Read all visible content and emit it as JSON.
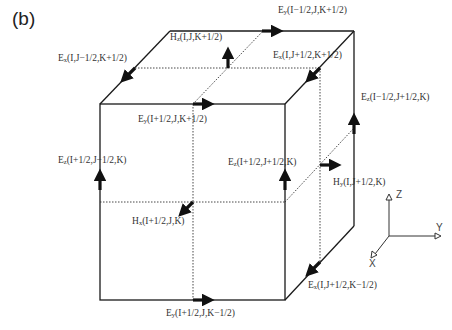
{
  "panel_label": "(b)",
  "colors": {
    "line": "#1a1a1a",
    "arrow": "#111111",
    "text": "#333333",
    "background": "#ffffff"
  },
  "labels": {
    "hz_top": {
      "sym": "H",
      "sub": "z",
      "args": "(I,J,K+1/2)"
    },
    "ey_back_top": {
      "sym": "E",
      "sub": "y",
      "args": "(I−1/2,J,K+1/2)"
    },
    "ex_left_top": {
      "sym": "E",
      "sub": "x",
      "args": "(I,J−1/2,K+1/2)"
    },
    "ex_right_top": {
      "sym": "E",
      "sub": "x",
      "args": "(I,J+1/2,K+1/2)"
    },
    "ey_front_top": {
      "sym": "E",
      "sub": "y",
      "args": "(I+1/2,J,K+1/2)"
    },
    "ez_back_right": {
      "sym": "E",
      "sub": "z",
      "args": "(I−1/2,J+1/2,K)"
    },
    "ez_front_left": {
      "sym": "E",
      "sub": "z",
      "args": "(I+1/2,J−1/2,K)"
    },
    "ez_front_right": {
      "sym": "E",
      "sub": "z",
      "args": "(I+1/2,J+1/2,K)"
    },
    "hy_right": {
      "sym": "H",
      "sub": "y",
      "args": "(I,J+1/2,K)"
    },
    "hx_front": {
      "sym": "H",
      "sub": "x",
      "args": "(I+1/2,J,K)"
    },
    "ex_right_bot": {
      "sym": "E",
      "sub": "x",
      "args": "(I,J+1/2,K−1/2)"
    },
    "ey_front_bot": {
      "sym": "E",
      "sub": "y",
      "args": "(I+1/2,J,K−1/2)"
    }
  },
  "axes": {
    "z": "Z",
    "y": "Y",
    "x": "X"
  }
}
